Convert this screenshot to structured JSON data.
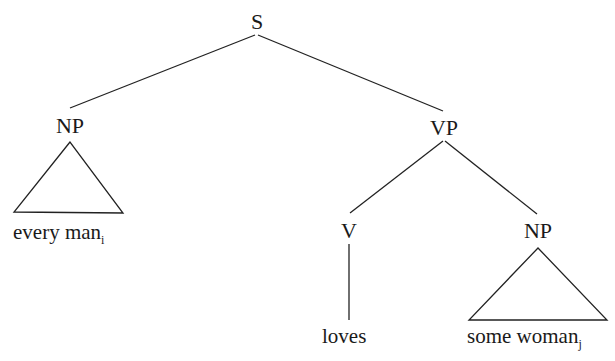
{
  "tree": {
    "nodes": {
      "S": "S",
      "np_subject": "NP",
      "vp": "VP",
      "v": "V",
      "np_object": "NP"
    },
    "leaves": {
      "subject": {
        "text": "every man",
        "index": "i"
      },
      "verb": {
        "text": "loves"
      },
      "object": {
        "text": "some woman",
        "index": "j"
      }
    },
    "edges": [
      [
        "S",
        "NP"
      ],
      [
        "S",
        "VP"
      ],
      [
        "VP",
        "V"
      ],
      [
        "VP",
        "NP"
      ],
      [
        "V",
        "loves"
      ],
      [
        "NP",
        "every man_i (triangle)"
      ],
      [
        "NP",
        "some woman_j (triangle)"
      ]
    ]
  }
}
